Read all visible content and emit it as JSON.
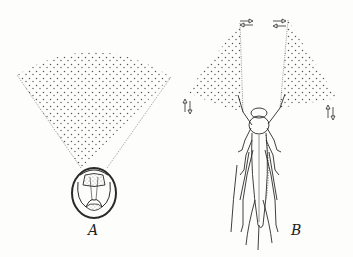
{
  "figure": {
    "panels": [
      {
        "id": "A",
        "label": "A",
        "description": "Head viewed frontally with conical field of view (stippled fan)"
      },
      {
        "id": "B",
        "label": "B",
        "description": "Insect dorsal view with two antennal sensory fans and movement arrows"
      }
    ],
    "colors": {
      "ink": "#2a2a2a",
      "stipple": "#555555",
      "background": "#fdfdfb"
    }
  }
}
